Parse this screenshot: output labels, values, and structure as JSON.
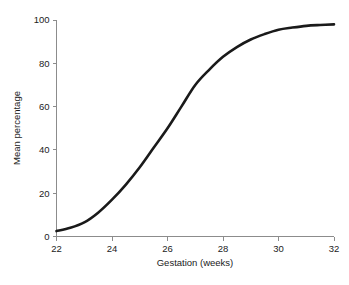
{
  "figure": {
    "background_color": "#ffffff",
    "caption_partial": ""
  },
  "chart_data": {
    "type": "line",
    "title": "",
    "subtitle": "",
    "xlabel": "Gestation (weeks)",
    "ylabel": "Mean percentage",
    "xlim": [
      22,
      32
    ],
    "ylim": [
      0,
      100
    ],
    "xticks": [
      22,
      24,
      26,
      28,
      30,
      32
    ],
    "xtick_labels": [
      "22",
      "24",
      "26",
      "28",
      "30",
      "32"
    ],
    "yticks": [
      0,
      20,
      40,
      60,
      80,
      100
    ],
    "ytick_labels": [
      "0",
      "20",
      "40",
      "60",
      "80",
      "100"
    ],
    "grid": false,
    "legend": null,
    "legend_position": "none",
    "annotations": [],
    "series": [
      {
        "name": "Mean percentage",
        "color": "#1a1a1a",
        "line_width": 2.6,
        "x": [
          22,
          22.5,
          23,
          23.5,
          24,
          24.5,
          25,
          25.5,
          26,
          26.5,
          27,
          27.5,
          28,
          28.5,
          29,
          29.5,
          30,
          30.5,
          31,
          31.5,
          32
        ],
        "values": [
          2.5,
          4,
          6.5,
          11,
          17,
          24,
          32,
          41,
          50,
          60,
          70,
          77,
          83,
          87.5,
          91,
          93.5,
          95.5,
          96.5,
          97.3,
          97.7,
          98
        ]
      }
    ]
  },
  "axes_style": {
    "axis_color": "#8c8c8c",
    "tick_color": "#8c8c8c",
    "text_color": "#222222"
  }
}
